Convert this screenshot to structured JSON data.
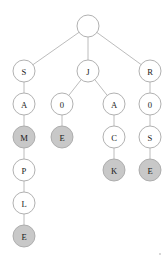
{
  "diagram": {
    "type": "tree",
    "canvas": {
      "width": 168,
      "height": 261,
      "background": "#ffffff"
    },
    "style": {
      "node_radius": 11,
      "node_fill_default": "#ffffff",
      "node_fill_highlighted": "#c8c8c8",
      "node_stroke": "#a8a8a8",
      "edge_stroke": "#b4b4b4",
      "label_color": "#1a1a1a"
    },
    "nodes": [
      {
        "id": "n0",
        "label": "",
        "x": 88,
        "y": 26,
        "filled": false,
        "depth": 0
      },
      {
        "id": "n1",
        "label": "S",
        "x": 24,
        "y": 71,
        "filled": false,
        "depth": 1
      },
      {
        "id": "n2",
        "label": "J",
        "x": 88,
        "y": 71,
        "filled": false,
        "depth": 1
      },
      {
        "id": "n3",
        "label": "R",
        "x": 150,
        "y": 71,
        "filled": false,
        "depth": 1
      },
      {
        "id": "n4",
        "label": "A",
        "x": 24,
        "y": 104,
        "filled": false,
        "depth": 2
      },
      {
        "id": "n5",
        "label": "0",
        "x": 62,
        "y": 104,
        "filled": false,
        "depth": 2
      },
      {
        "id": "n6",
        "label": "A",
        "x": 114,
        "y": 104,
        "filled": false,
        "depth": 2
      },
      {
        "id": "n7",
        "label": "0",
        "x": 150,
        "y": 104,
        "filled": false,
        "depth": 2
      },
      {
        "id": "n8",
        "label": "M",
        "x": 24,
        "y": 137,
        "filled": true,
        "depth": 3
      },
      {
        "id": "n9",
        "label": "E",
        "x": 62,
        "y": 137,
        "filled": true,
        "depth": 3
      },
      {
        "id": "n10",
        "label": "C",
        "x": 114,
        "y": 137,
        "filled": false,
        "depth": 3
      },
      {
        "id": "n11",
        "label": "S",
        "x": 150,
        "y": 137,
        "filled": false,
        "depth": 3
      },
      {
        "id": "n12",
        "label": "P",
        "x": 24,
        "y": 170,
        "filled": false,
        "depth": 4
      },
      {
        "id": "n13",
        "label": "K",
        "x": 114,
        "y": 170,
        "filled": true,
        "depth": 4
      },
      {
        "id": "n14",
        "label": "E",
        "x": 150,
        "y": 170,
        "filled": true,
        "depth": 4
      },
      {
        "id": "n15",
        "label": "L",
        "x": 24,
        "y": 203,
        "filled": false,
        "depth": 5
      },
      {
        "id": "n16",
        "label": "E",
        "x": 24,
        "y": 236,
        "filled": true,
        "depth": 6
      }
    ],
    "edges": [
      {
        "from": "n0",
        "to": "n1"
      },
      {
        "from": "n0",
        "to": "n2"
      },
      {
        "from": "n0",
        "to": "n3"
      },
      {
        "from": "n1",
        "to": "n4"
      },
      {
        "from": "n2",
        "to": "n5"
      },
      {
        "from": "n2",
        "to": "n6"
      },
      {
        "from": "n3",
        "to": "n7"
      },
      {
        "from": "n4",
        "to": "n8"
      },
      {
        "from": "n5",
        "to": "n9"
      },
      {
        "from": "n6",
        "to": "n10"
      },
      {
        "from": "n7",
        "to": "n11"
      },
      {
        "from": "n8",
        "to": "n12"
      },
      {
        "from": "n10",
        "to": "n13"
      },
      {
        "from": "n11",
        "to": "n14"
      },
      {
        "from": "n12",
        "to": "n15"
      },
      {
        "from": "n15",
        "to": "n16"
      }
    ]
  }
}
